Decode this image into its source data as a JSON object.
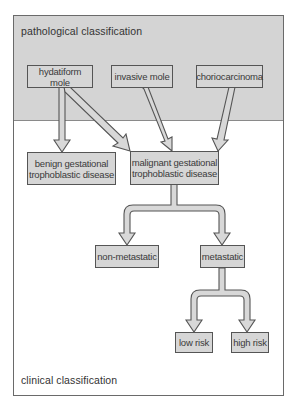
{
  "diagram": {
    "regions": {
      "top_label": "pathological classification",
      "bottom_label": "clinical classification"
    },
    "nodes": {
      "hydatiform_mole": "hydatiform mole",
      "invasive_mole": "invasive mole",
      "choriocarcinoma": "choriocarcinoma",
      "benign_line1": "benign gestational",
      "benign_line2": "trophoblastic disease",
      "malignant_line1": "malignant gestational",
      "malignant_line2": "trophoblastic disease",
      "non_metastatic": "non-metastatic",
      "metastatic": "metastatic",
      "low_risk": "low risk",
      "high_risk": "high risk"
    },
    "edges": [
      {
        "from": "hydatiform mole",
        "to": "benign gestational trophoblastic disease"
      },
      {
        "from": "hydatiform mole",
        "to": "malignant gestational trophoblastic disease"
      },
      {
        "from": "invasive mole",
        "to": "malignant gestational trophoblastic disease"
      },
      {
        "from": "choriocarcinoma",
        "to": "malignant gestational trophoblastic disease"
      },
      {
        "from": "malignant gestational trophoblastic disease",
        "to": "non-metastatic"
      },
      {
        "from": "malignant gestational trophoblastic disease",
        "to": "metastatic"
      },
      {
        "from": "metastatic",
        "to": "low risk"
      },
      {
        "from": "metastatic",
        "to": "high risk"
      }
    ],
    "colors": {
      "band": "#d4d4d4",
      "box_fill": "#d6d6d6",
      "arrow_fill": "#d8d8d8",
      "outline": "#555555"
    }
  }
}
